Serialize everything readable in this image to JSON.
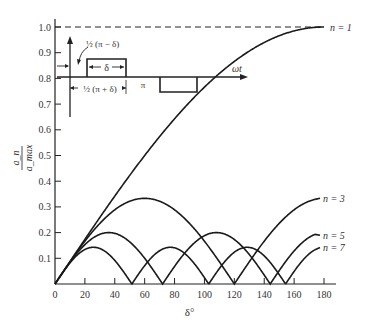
{
  "chart_data": {
    "type": "line",
    "title": "",
    "xlabel": "δ°",
    "ylabel": "a_n / a_max",
    "ylabel_num": "a_n",
    "ylabel_den": "a_max",
    "xlim": [
      0,
      180
    ],
    "ylim": [
      0,
      1.0
    ],
    "x_ticks": [
      0,
      20,
      40,
      60,
      80,
      100,
      120,
      140,
      160,
      180
    ],
    "y_ticks": [
      0.1,
      0.2,
      0.3,
      0.4,
      0.5,
      0.6,
      0.7,
      0.8,
      0.9,
      1.0
    ],
    "grid": false,
    "reference_line": {
      "y": 1.0,
      "style": "dashed"
    },
    "formula": "|sin(n·δ/2)| / n",
    "series": [
      {
        "name": "n = 1",
        "n": 1,
        "x": [
          0,
          20,
          40,
          60,
          80,
          100,
          120,
          140,
          160,
          180
        ],
        "values": [
          0,
          0.174,
          0.342,
          0.5,
          0.643,
          0.766,
          0.866,
          0.94,
          0.985,
          1.0
        ]
      },
      {
        "name": "n = 3",
        "n": 3,
        "x": [
          0,
          20,
          40,
          60,
          80,
          100,
          120,
          140,
          160,
          175
        ],
        "values": [
          0,
          0.167,
          0.289,
          0.333,
          0.289,
          0.167,
          0,
          0.167,
          0.289,
          0.33
        ]
      },
      {
        "name": "n = 5",
        "n": 5,
        "x": [
          0,
          20,
          36,
          52,
          72,
          90,
          108,
          126,
          144,
          175
        ],
        "values": [
          0,
          0.171,
          0.2,
          0.153,
          0,
          0.141,
          0.2,
          0.141,
          0,
          0.19
        ]
      },
      {
        "name": "n = 7",
        "n": 7,
        "x": [
          0,
          15,
          26,
          40,
          51,
          64,
          77,
          90,
          103,
          116,
          129,
          142,
          154,
          175
        ],
        "values": [
          0,
          0.125,
          0.143,
          0.1,
          0,
          0.1,
          0.143,
          0.1,
          0,
          0.1,
          0.143,
          0.1,
          0,
          0.14
        ]
      }
    ],
    "inset": {
      "labels": {
        "half_pi_minus_delta": "½ (π − δ)",
        "delta": "δ",
        "half_pi_plus_delta": "½ (π + δ)",
        "pi": "π",
        "omega_t": "ωt"
      }
    }
  }
}
